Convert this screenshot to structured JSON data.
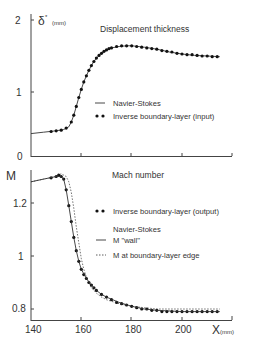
{
  "chart_data": [
    {
      "type": "line",
      "title": "Displacement thickness",
      "xlabel": "X (mm)",
      "ylabel": "δ* (mm)",
      "xlim": [
        140,
        220
      ],
      "ylim": [
        0,
        2
      ],
      "yticks": [
        "0",
        "1",
        "2"
      ],
      "grid": false,
      "legend_position": "right-middle",
      "series": [
        {
          "name": "Navier-Stokes",
          "style": "solid",
          "x": [
            140,
            145,
            150,
            153,
            155,
            156,
            157,
            158,
            159,
            160,
            161,
            162,
            163,
            164,
            165,
            166,
            168,
            170,
            172,
            175,
            178,
            180,
            185,
            190,
            195,
            200,
            205,
            210,
            215
          ],
          "y": [
            0.33,
            0.35,
            0.37,
            0.39,
            0.43,
            0.5,
            0.6,
            0.73,
            0.86,
            0.98,
            1.09,
            1.18,
            1.26,
            1.33,
            1.39,
            1.44,
            1.51,
            1.56,
            1.59,
            1.61,
            1.62,
            1.62,
            1.6,
            1.57,
            1.53,
            1.5,
            1.48,
            1.47,
            1.46
          ]
        },
        {
          "name": "Inverse boundary-layer (input)",
          "style": "dots",
          "x": [
            148,
            150,
            152,
            154,
            156,
            157,
            158,
            159,
            160,
            161,
            162,
            163,
            164,
            165,
            166,
            167,
            168,
            169,
            170,
            171,
            172,
            174,
            176,
            178,
            180,
            182,
            184,
            186,
            188,
            190,
            192,
            194,
            196,
            198,
            200,
            202,
            204,
            206,
            208,
            210,
            212,
            214
          ],
          "y": [
            0.36,
            0.37,
            0.38,
            0.41,
            0.5,
            0.6,
            0.73,
            0.86,
            0.98,
            1.09,
            1.18,
            1.26,
            1.33,
            1.39,
            1.44,
            1.48,
            1.51,
            1.54,
            1.56,
            1.58,
            1.59,
            1.61,
            1.62,
            1.62,
            1.62,
            1.61,
            1.6,
            1.59,
            1.58,
            1.57,
            1.55,
            1.54,
            1.53,
            1.51,
            1.5,
            1.49,
            1.49,
            1.48,
            1.47,
            1.47,
            1.46,
            1.46
          ]
        }
      ]
    },
    {
      "type": "line",
      "title": "Mach number",
      "xlabel": "X (mm)",
      "ylabel": "M",
      "xlim": [
        140,
        220
      ],
      "ylim": [
        0.75,
        1.33
      ],
      "xticks": [
        "140",
        "160",
        "180",
        "200"
      ],
      "yticks": [
        "0.8",
        "1",
        "1.2"
      ],
      "grid": false,
      "legend_position": "right-middle",
      "series": [
        {
          "name": "Inverse boundary-layer (output)",
          "style": "dots",
          "x": [
            148,
            150,
            151,
            152,
            153,
            154,
            155,
            156,
            157,
            158,
            159,
            160,
            161,
            162,
            163,
            164,
            165,
            166,
            168,
            170,
            172,
            174,
            176,
            178,
            180,
            182,
            184,
            186,
            188,
            190,
            192,
            194,
            196,
            198,
            200,
            202,
            204,
            206,
            208,
            210,
            212,
            214
          ],
          "y": [
            1.295,
            1.3,
            1.305,
            1.3,
            1.29,
            1.25,
            1.19,
            1.13,
            1.07,
            1.02,
            0.98,
            0.95,
            0.93,
            0.915,
            0.9,
            0.89,
            0.88,
            0.87,
            0.855,
            0.845,
            0.835,
            0.825,
            0.82,
            0.815,
            0.81,
            0.805,
            0.8,
            0.8,
            0.795,
            0.795,
            0.79,
            0.79,
            0.79,
            0.79,
            0.79,
            0.79,
            0.79,
            0.79,
            0.79,
            0.79,
            0.79,
            0.79
          ]
        },
        {
          "name": "Navier-Stokes M \"wall\"",
          "style": "solid",
          "x": [
            140,
            145,
            150,
            152,
            153,
            154,
            155,
            156,
            157,
            158,
            159,
            160,
            162,
            164,
            166,
            168,
            170,
            175,
            180,
            185,
            190,
            200,
            215
          ],
          "y": [
            1.28,
            1.29,
            1.3,
            1.3,
            1.29,
            1.25,
            1.19,
            1.13,
            1.07,
            1.02,
            0.98,
            0.95,
            0.915,
            0.89,
            0.87,
            0.855,
            0.845,
            0.825,
            0.81,
            0.8,
            0.795,
            0.79,
            0.79
          ]
        },
        {
          "name": "M at boundary-layer edge",
          "style": "dashed",
          "x": [
            140,
            145,
            150,
            152,
            154,
            155,
            156,
            157,
            158,
            159,
            160,
            161,
            162,
            164,
            166,
            168,
            170,
            175,
            180,
            185,
            190,
            200,
            215
          ],
          "y": [
            1.28,
            1.29,
            1.3,
            1.31,
            1.3,
            1.28,
            1.24,
            1.18,
            1.11,
            1.05,
            0.99,
            0.95,
            0.92,
            0.88,
            0.86,
            0.845,
            0.835,
            0.82,
            0.81,
            0.805,
            0.8,
            0.8,
            0.8
          ]
        }
      ]
    }
  ],
  "top": {
    "title": "Displacement thickness",
    "ylabel": "δ",
    "ylabel_sup": "*",
    "ylabel_unit": "(mm)",
    "yticks": [
      "0",
      "1",
      "2"
    ],
    "legend": {
      "solid": "Navier-Stokes",
      "dots": "Inverse boundary-layer (input)"
    }
  },
  "bottom": {
    "title": "Mach number",
    "ylabel": "M",
    "yticks": [
      "0.8",
      "1",
      "1.2"
    ],
    "xticks": [
      "140",
      "160",
      "180",
      "200"
    ],
    "xlabel": "X",
    "xlabel_unit": "(mm)",
    "legend": {
      "dots": "Inverse boundary-layer (output)",
      "group": "Navier-Stokes",
      "solid": "M \"wall\"",
      "dashed": "M at boundary-layer edge"
    }
  }
}
